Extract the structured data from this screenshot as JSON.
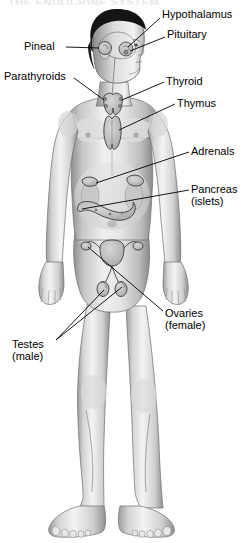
{
  "figure": {
    "title": "THE ENDOCRINE SYSTEM",
    "background_color": "#ffffff",
    "line_color": "#000000",
    "text_color": "#000000",
    "skin_light": "#f2f2f2",
    "skin_mid": "#c9c9c9",
    "skin_shadow": "#8f8f8f",
    "hair_color": "#1a1a1a",
    "organ_fill": "#b8b8b8"
  },
  "labels": {
    "hypothalamus": "Hypothalamus",
    "pituitary": "Pituitary",
    "pineal": "Pineal",
    "parathyroids": "Parathyroids",
    "thyroid": "Thyroid",
    "thymus": "Thymus",
    "adrenals": "Adrenals",
    "pancreas_line1": "Pancreas",
    "pancreas_line2": "(islets)",
    "ovaries_line1": "Ovaries",
    "ovaries_line2": "(female)",
    "testes_line1": "Testes",
    "testes_line2": "(male)"
  },
  "callouts": [
    {
      "name": "hypothalamus",
      "side": "right",
      "text_x": 163,
      "text_y": 14,
      "target_x": 119,
      "target_y": 44
    },
    {
      "name": "pituitary",
      "side": "right",
      "text_x": 168,
      "text_y": 33,
      "target_x": 120,
      "target_y": 48
    },
    {
      "name": "pineal",
      "side": "left",
      "text_x": 25,
      "text_y": 42,
      "target_x": 100,
      "target_y": 47
    },
    {
      "name": "parathyroids",
      "side": "left",
      "text_x": 5,
      "text_y": 72,
      "target_x": 108,
      "target_y": 103
    },
    {
      "name": "thyroid",
      "side": "right",
      "text_x": 167,
      "text_y": 78,
      "target_x": 122,
      "target_y": 100
    },
    {
      "name": "thymus",
      "side": "right",
      "text_x": 178,
      "text_y": 100,
      "target_x": 118,
      "target_y": 128
    },
    {
      "name": "adrenals",
      "side": "right",
      "text_x": 192,
      "text_y": 148,
      "target_x": 112,
      "target_y": 183
    },
    {
      "name": "pancreas",
      "side": "right",
      "text_x": 192,
      "text_y": 186,
      "target_x": 104,
      "target_y": 212
    },
    {
      "name": "ovaries",
      "side": "right",
      "text_x": 166,
      "text_y": 312,
      "target_x": 100,
      "target_y": 258
    },
    {
      "name": "testes",
      "side": "left",
      "text_x": 13,
      "text_y": 343,
      "target_x": 113,
      "target_y": 282
    }
  ],
  "glands_depicted": [
    "hypothalamus",
    "pituitary",
    "pineal",
    "thyroid",
    "parathyroids",
    "thymus",
    "adrenals",
    "pancreas (islets)",
    "ovaries",
    "testes"
  ]
}
